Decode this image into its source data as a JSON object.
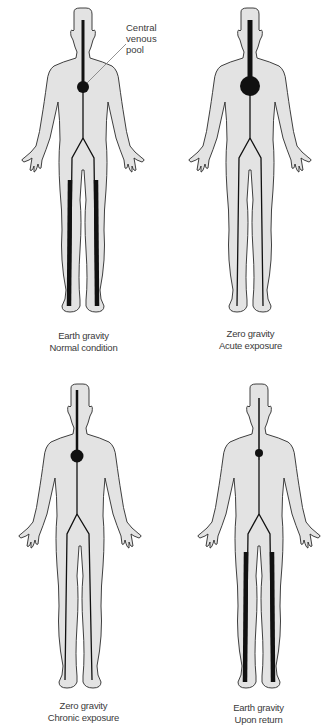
{
  "figure": {
    "callout": {
      "line1": "Central",
      "line2": "venous",
      "line3": "pool"
    },
    "panels": [
      {
        "id": "earth-normal",
        "caption_line1": "Earth gravity",
        "caption_line2": "Normal condition",
        "pool_radius": 6,
        "head_vein_width": 3,
        "leg_vein_width": 4.5
      },
      {
        "id": "zero-acute",
        "caption_line1": "Zero gravity",
        "caption_line2": "Acute exposure",
        "pool_radius": 10,
        "head_vein_width": 5,
        "leg_vein_width": 1.3
      },
      {
        "id": "zero-chronic",
        "caption_line1": "Zero gravity",
        "caption_line2": "Chronic exposure",
        "pool_radius": 6.5,
        "head_vein_width": 3,
        "leg_vein_width": 1.3
      },
      {
        "id": "earth-return",
        "caption_line1": "Earth gravity",
        "caption_line2": "Upon return",
        "pool_radius": 4,
        "head_vein_width": 1.5,
        "leg_vein_width": 4.5
      }
    ],
    "colors": {
      "body_fill": "#e3e3e3",
      "body_outline": "#2a2a2a",
      "vein": "#111111",
      "pointer_line": "#777777"
    }
  }
}
